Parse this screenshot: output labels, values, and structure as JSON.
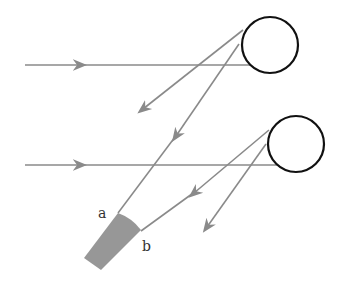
{
  "diagram": {
    "type": "optics-ray-diagram",
    "labels": {
      "a": "a",
      "b": "b"
    },
    "colors": {
      "ray": "#8a8a8a",
      "circle": "#111111",
      "shade": "#8c8c8c"
    },
    "circles": [
      {
        "id": "droplet-1",
        "cx": 270,
        "cy": 45,
        "r": 28
      },
      {
        "id": "droplet-2",
        "cx": 296,
        "cy": 144,
        "r": 28
      }
    ]
  }
}
